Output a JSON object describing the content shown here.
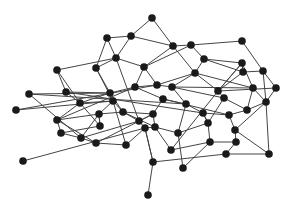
{
  "diagram": {
    "type": "network-graph",
    "node_radius": 3.8,
    "node_color": "#1a1a1a",
    "edge_color": "#444444",
    "background": "#ffffff",
    "nodes": [
      {
        "id": 0,
        "x": 152,
        "y": 18
      },
      {
        "id": 1,
        "x": 107,
        "y": 38
      },
      {
        "id": 2,
        "x": 131,
        "y": 36
      },
      {
        "id": 3,
        "x": 173,
        "y": 46
      },
      {
        "id": 4,
        "x": 191,
        "y": 45
      },
      {
        "id": 5,
        "x": 242,
        "y": 41
      },
      {
        "id": 6,
        "x": 57,
        "y": 70
      },
      {
        "id": 7,
        "x": 96,
        "y": 68
      },
      {
        "id": 8,
        "x": 116,
        "y": 58
      },
      {
        "id": 9,
        "x": 144,
        "y": 67
      },
      {
        "id": 10,
        "x": 204,
        "y": 59
      },
      {
        "id": 11,
        "x": 242,
        "y": 63
      },
      {
        "id": 12,
        "x": 243,
        "y": 72
      },
      {
        "id": 13,
        "x": 263,
        "y": 71
      },
      {
        "id": 14,
        "x": 29,
        "y": 94
      },
      {
        "id": 15,
        "x": 66,
        "y": 92
      },
      {
        "id": 16,
        "x": 80,
        "y": 103
      },
      {
        "id": 17,
        "x": 110,
        "y": 93
      },
      {
        "id": 18,
        "x": 135,
        "y": 87
      },
      {
        "id": 19,
        "x": 157,
        "y": 85
      },
      {
        "id": 20,
        "x": 172,
        "y": 87
      },
      {
        "id": 21,
        "x": 195,
        "y": 73
      },
      {
        "id": 22,
        "x": 218,
        "y": 91
      },
      {
        "id": 23,
        "x": 253,
        "y": 88
      },
      {
        "id": 24,
        "x": 276,
        "y": 88
      },
      {
        "id": 25,
        "x": 16,
        "y": 110
      },
      {
        "id": 26,
        "x": 113,
        "y": 101
      },
      {
        "id": 27,
        "x": 99,
        "y": 114
      },
      {
        "id": 28,
        "x": 123,
        "y": 112
      },
      {
        "id": 29,
        "x": 139,
        "y": 121
      },
      {
        "id": 30,
        "x": 153,
        "y": 114
      },
      {
        "id": 31,
        "x": 163,
        "y": 99
      },
      {
        "id": 32,
        "x": 186,
        "y": 104
      },
      {
        "id": 33,
        "x": 203,
        "y": 113
      },
      {
        "id": 34,
        "x": 229,
        "y": 115
      },
      {
        "id": 35,
        "x": 247,
        "y": 110
      },
      {
        "id": 36,
        "x": 266,
        "y": 102
      },
      {
        "id": 37,
        "x": 224,
        "y": 98
      },
      {
        "id": 38,
        "x": 57,
        "y": 120
      },
      {
        "id": 39,
        "x": 61,
        "y": 133
      },
      {
        "id": 40,
        "x": 81,
        "y": 138
      },
      {
        "id": 41,
        "x": 96,
        "y": 143
      },
      {
        "id": 42,
        "x": 145,
        "y": 128
      },
      {
        "id": 43,
        "x": 155,
        "y": 127
      },
      {
        "id": 44,
        "x": 126,
        "y": 145
      },
      {
        "id": 45,
        "x": 178,
        "y": 133
      },
      {
        "id": 46,
        "x": 171,
        "y": 150
      },
      {
        "id": 47,
        "x": 210,
        "y": 142
      },
      {
        "id": 48,
        "x": 235,
        "y": 130
      },
      {
        "id": 49,
        "x": 236,
        "y": 142
      },
      {
        "id": 50,
        "x": 226,
        "y": 154
      },
      {
        "id": 51,
        "x": 269,
        "y": 154
      },
      {
        "id": 52,
        "x": 153,
        "y": 162
      },
      {
        "id": 53,
        "x": 183,
        "y": 168
      },
      {
        "id": 54,
        "x": 23,
        "y": 161
      },
      {
        "id": 55,
        "x": 148,
        "y": 195
      },
      {
        "id": 56,
        "x": 100,
        "y": 126
      },
      {
        "id": 57,
        "x": 208,
        "y": 123
      }
    ],
    "edges": [
      [
        0,
        2
      ],
      [
        0,
        3
      ],
      [
        1,
        2
      ],
      [
        1,
        7
      ],
      [
        2,
        8
      ],
      [
        2,
        3
      ],
      [
        3,
        4
      ],
      [
        4,
        5
      ],
      [
        4,
        10
      ],
      [
        4,
        9
      ],
      [
        5,
        13
      ],
      [
        3,
        9
      ],
      [
        3,
        21
      ],
      [
        1,
        8
      ],
      [
        6,
        8
      ],
      [
        6,
        15
      ],
      [
        7,
        8
      ],
      [
        7,
        17
      ],
      [
        7,
        26
      ],
      [
        8,
        9
      ],
      [
        8,
        29
      ],
      [
        9,
        19
      ],
      [
        9,
        18
      ],
      [
        10,
        21
      ],
      [
        10,
        12
      ],
      [
        11,
        12
      ],
      [
        11,
        22
      ],
      [
        11,
        23
      ],
      [
        12,
        13
      ],
      [
        12,
        22
      ],
      [
        13,
        24
      ],
      [
        13,
        36
      ],
      [
        14,
        17
      ],
      [
        14,
        40
      ],
      [
        15,
        17
      ],
      [
        15,
        16
      ],
      [
        15,
        33
      ],
      [
        16,
        26
      ],
      [
        16,
        38
      ],
      [
        17,
        18
      ],
      [
        17,
        28
      ],
      [
        18,
        19
      ],
      [
        18,
        31
      ],
      [
        18,
        38
      ],
      [
        19,
        20
      ],
      [
        19,
        21
      ],
      [
        20,
        21
      ],
      [
        20,
        32
      ],
      [
        20,
        23
      ],
      [
        21,
        22
      ],
      [
        21,
        23
      ],
      [
        22,
        37
      ],
      [
        22,
        24
      ],
      [
        22,
        46
      ],
      [
        23,
        36
      ],
      [
        23,
        35
      ],
      [
        24,
        36
      ],
      [
        25,
        26
      ],
      [
        25,
        19
      ],
      [
        26,
        28
      ],
      [
        26,
        27
      ],
      [
        27,
        40
      ],
      [
        27,
        56
      ],
      [
        28,
        30
      ],
      [
        28,
        29
      ],
      [
        28,
        43
      ],
      [
        29,
        42
      ],
      [
        30,
        31
      ],
      [
        30,
        43
      ],
      [
        31,
        32
      ],
      [
        31,
        34
      ],
      [
        32,
        33
      ],
      [
        32,
        45
      ],
      [
        33,
        34
      ],
      [
        33,
        57
      ],
      [
        34,
        35
      ],
      [
        34,
        48
      ],
      [
        35,
        37
      ],
      [
        35,
        36
      ],
      [
        36,
        48
      ],
      [
        37,
        20
      ],
      [
        38,
        39
      ],
      [
        38,
        41
      ],
      [
        38,
        27
      ],
      [
        39,
        56
      ],
      [
        40,
        41
      ],
      [
        40,
        29
      ],
      [
        41,
        44
      ],
      [
        41,
        30
      ],
      [
        42,
        44
      ],
      [
        42,
        43
      ],
      [
        42,
        52
      ],
      [
        43,
        45
      ],
      [
        43,
        46
      ],
      [
        44,
        26
      ],
      [
        45,
        57
      ],
      [
        45,
        53
      ],
      [
        46,
        47
      ],
      [
        47,
        49
      ],
      [
        48,
        49
      ],
      [
        48,
        51
      ],
      [
        49,
        50
      ],
      [
        50,
        51
      ],
      [
        50,
        52
      ],
      [
        51,
        36
      ],
      [
        52,
        55
      ],
      [
        52,
        42
      ],
      [
        53,
        47
      ],
      [
        54,
        42
      ],
      [
        56,
        16
      ],
      [
        56,
        27
      ],
      [
        57,
        47
      ],
      [
        57,
        37
      ],
      [
        14,
        32
      ],
      [
        6,
        16
      ],
      [
        11,
        22
      ],
      [
        29,
        30
      ],
      [
        39,
        40
      ],
      [
        10,
        11
      ],
      [
        27,
        28
      ],
      [
        16,
        17
      ],
      [
        33,
        57
      ]
    ]
  }
}
